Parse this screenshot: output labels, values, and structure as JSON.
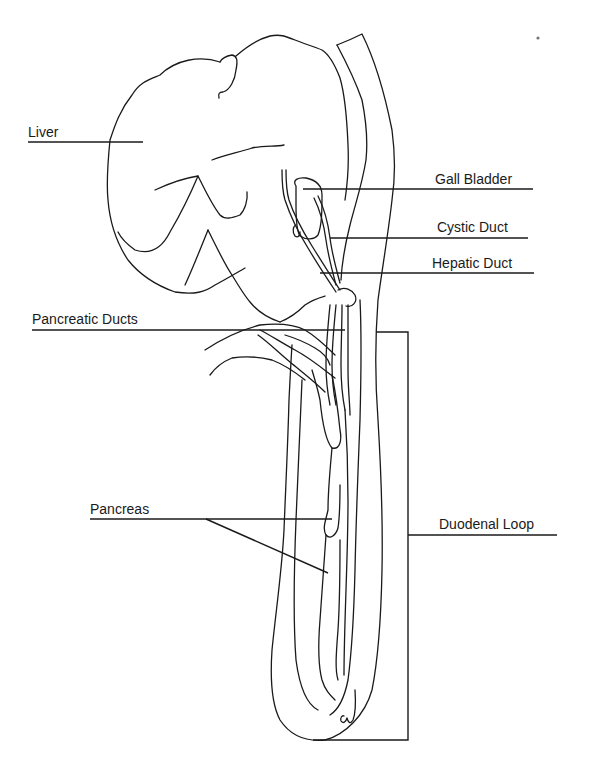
{
  "diagram": {
    "type": "anatomical line drawing",
    "labels": {
      "liver": "Liver",
      "gall_bladder": "Gall Bladder",
      "cystic_duct": "Cystic Duct",
      "hepatic_duct": "Hepatic Duct",
      "pancreatic_ducts": "Pancreatic Ducts",
      "pancreas": "Pancreas",
      "duodenal_loop": "Duodenal Loop"
    },
    "colors": {
      "line": "#1a1a1a",
      "background": "#ffffff"
    }
  }
}
